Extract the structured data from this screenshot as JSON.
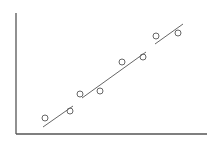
{
  "chart_data": {
    "type": "scatter",
    "title": "",
    "xlabel": "",
    "ylabel": "",
    "xlim": [
      0,
      191
    ],
    "ylim": [
      0,
      121
    ],
    "grid": false,
    "legend": null,
    "ticks": {
      "x": [],
      "y": []
    },
    "series": [
      {
        "name": "observations",
        "marker": "open-circle",
        "points": [
          {
            "x": 29,
            "y": 16
          },
          {
            "x": 54,
            "y": 23
          },
          {
            "x": 64,
            "y": 40
          },
          {
            "x": 84,
            "y": 43
          },
          {
            "x": 106,
            "y": 72
          },
          {
            "x": 127,
            "y": 77
          },
          {
            "x": 140,
            "y": 98
          },
          {
            "x": 162,
            "y": 101
          }
        ]
      }
    ],
    "trend_line": {
      "name": "fit",
      "style": "broken-segments",
      "segments": [
        {
          "x1": 27,
          "y1": 7,
          "x2": 57,
          "y2": 28
        },
        {
          "x1": 66,
          "y1": 36,
          "x2": 130,
          "y2": 82
        },
        {
          "x1": 139,
          "y1": 90,
          "x2": 167,
          "y2": 110
        }
      ]
    }
  },
  "layout": {
    "origin_px": {
      "x": 16,
      "y": 134
    },
    "y_axis_top_px": 13,
    "x_axis_right_px": 207,
    "axis_color": "#555555",
    "line_color": "#666666",
    "marker_color": "#666666",
    "marker_radius": 3
  }
}
